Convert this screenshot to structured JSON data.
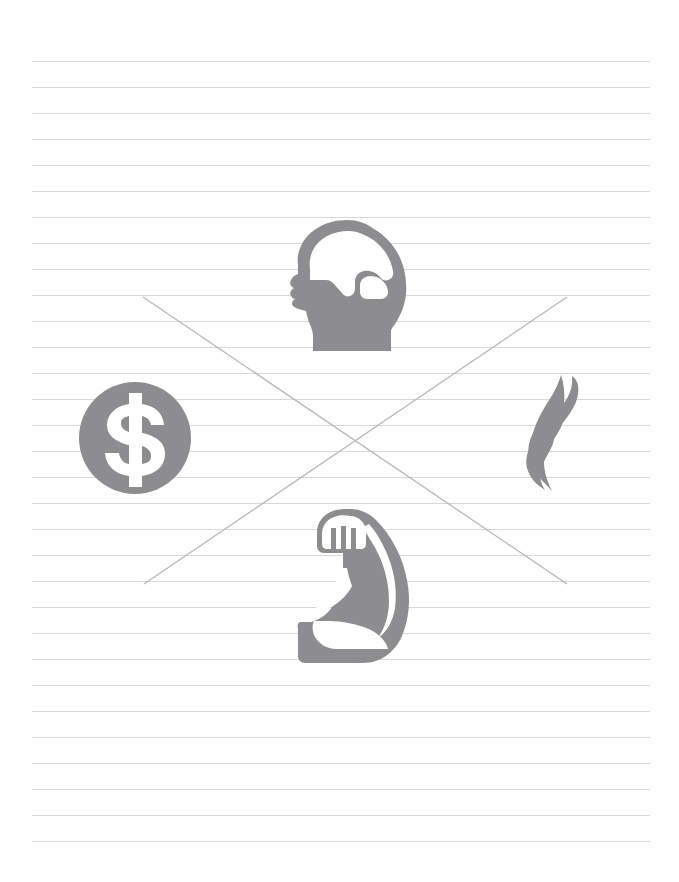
{
  "page": {
    "background_color": "#ffffff",
    "width": 679,
    "height": 882
  },
  "paper": {
    "name": "ruled-notebook-paper",
    "rule_color": "#d8d8da",
    "rule_left": 32,
    "rule_right": 650,
    "rule_first_y": 61,
    "rule_spacing": 26,
    "rule_count": 31,
    "rule_thickness": 1
  },
  "cross": {
    "name": "x-cross-overlay",
    "color": "#b8b8bb",
    "stroke_width": 1.3,
    "lines": [
      {
        "name": "diagonal-top-left-to-bottom-right",
        "x1": 143,
        "y1": 297,
        "x2": 567,
        "y2": 584
      },
      {
        "name": "diagonal-bottom-left-to-top-right",
        "x1": 144,
        "y1": 584,
        "x2": 567,
        "y2": 297
      }
    ],
    "center": {
      "x": 355,
      "y": 440
    }
  },
  "icons": {
    "fill_color": "#8d8d8f",
    "items": [
      {
        "name": "brain-head-icon",
        "label": "Head with brain",
        "position": "top",
        "x": 285,
        "y": 218,
        "width": 125,
        "height": 135
      },
      {
        "name": "dollar-circle-icon",
        "label": "Dollar sign in circle",
        "symbol": "$",
        "position": "left",
        "x": 78,
        "y": 381,
        "width": 114,
        "height": 114
      },
      {
        "name": "flame-icon",
        "label": "Flame with three tongues",
        "position": "right",
        "x": 528,
        "y": 374,
        "width": 58,
        "height": 120
      },
      {
        "name": "flexed-bicep-icon",
        "label": "Flexed arm muscle",
        "position": "bottom",
        "x": 297,
        "y": 508,
        "width": 115,
        "height": 160
      }
    ]
  }
}
